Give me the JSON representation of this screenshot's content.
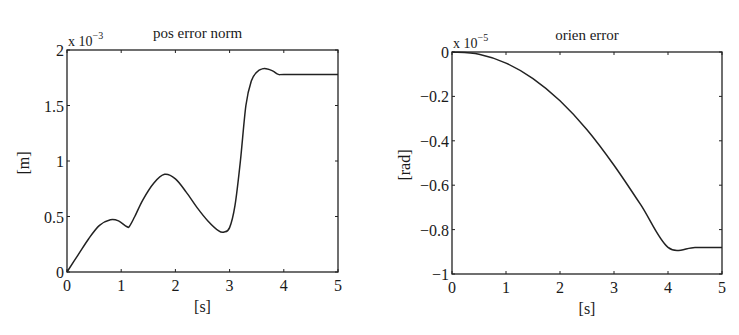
{
  "chart_data": [
    {
      "type": "line",
      "title": "pos error norm",
      "xlabel": "[s]",
      "ylabel": "[m]",
      "y_multiplier": "x 10",
      "y_exponent": "-3",
      "xlim": [
        0,
        5
      ],
      "ylim": [
        0,
        2
      ],
      "x_ticks": [
        "0",
        "1",
        "2",
        "3",
        "4",
        "5"
      ],
      "y_ticks": [
        "0",
        "0.5",
        "1",
        "1.5",
        "2"
      ],
      "grid": false,
      "series": [
        {
          "name": "pos error norm",
          "x": [
            0,
            0.2,
            0.4,
            0.6,
            0.8,
            0.95,
            1.1,
            1.15,
            1.25,
            1.4,
            1.6,
            1.8,
            2.0,
            2.2,
            2.4,
            2.6,
            2.8,
            2.9,
            3.0,
            3.1,
            3.2,
            3.3,
            3.4,
            3.5,
            3.6,
            3.7,
            3.8,
            3.9,
            4.0,
            4.5,
            5.0
          ],
          "values": [
            0,
            0.15,
            0.3,
            0.42,
            0.47,
            0.46,
            0.41,
            0.41,
            0.5,
            0.65,
            0.8,
            0.88,
            0.84,
            0.72,
            0.58,
            0.46,
            0.37,
            0.36,
            0.4,
            0.6,
            1.0,
            1.5,
            1.72,
            1.8,
            1.83,
            1.83,
            1.81,
            1.78,
            1.78,
            1.78,
            1.78
          ]
        }
      ]
    },
    {
      "type": "line",
      "title": "orien error",
      "xlabel": "[s]",
      "ylabel": "[rad]",
      "y_multiplier": "x 10",
      "y_exponent": "-5",
      "xlim": [
        0,
        5
      ],
      "ylim": [
        -1,
        0
      ],
      "x_ticks": [
        "0",
        "1",
        "2",
        "3",
        "4",
        "5"
      ],
      "y_ticks": [
        "0",
        "-0.2",
        "-0.4",
        "-0.6",
        "-0.8",
        "-1"
      ],
      "grid": false,
      "series": [
        {
          "name": "orien error",
          "x": [
            0,
            0.5,
            1.0,
            1.5,
            2.0,
            2.5,
            3.0,
            3.5,
            4.0,
            4.5,
            5.0
          ],
          "values": [
            0,
            -0.01,
            -0.05,
            -0.12,
            -0.22,
            -0.35,
            -0.51,
            -0.69,
            -0.88,
            -0.88,
            -0.88
          ]
        }
      ]
    }
  ]
}
